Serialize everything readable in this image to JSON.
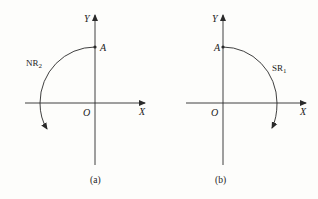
{
  "panels": [
    {
      "id": "a",
      "caption": "(a)",
      "x_axis_label": "X",
      "y_axis_label": "Y",
      "origin_label": "O",
      "point_label": "A",
      "arc_label": "NR",
      "arc_label_sub": "2",
      "arc_direction": "counterclockwise"
    },
    {
      "id": "b",
      "caption": "(b)",
      "x_axis_label": "X",
      "y_axis_label": "Y",
      "origin_label": "O",
      "point_label": "A",
      "arc_label": "SR",
      "arc_label_sub": "1",
      "arc_direction": "clockwise"
    }
  ],
  "colors": {
    "line": "#2a2a2a",
    "background": "#fdfdfb"
  }
}
